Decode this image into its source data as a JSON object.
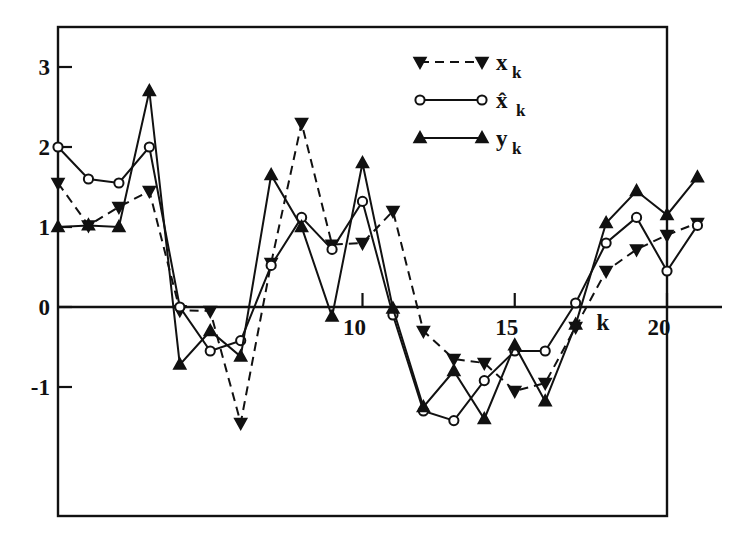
{
  "figure": {
    "background": "#ffffff",
    "ink_color": "#111111",
    "frame": {
      "left": 58,
      "right": 667,
      "top": 27,
      "bottom": 516
    }
  },
  "axes": {
    "y_ticks": [
      "3",
      "2",
      "1",
      "0",
      "-1"
    ],
    "y_tick_values": [
      3,
      2,
      1,
      0,
      -1
    ],
    "x_ticks": [
      "10",
      "15",
      "20"
    ],
    "x_tick_values": [
      10,
      15,
      20
    ],
    "x_axis_title": "k",
    "y_axis_title": "",
    "zero_line": true,
    "grid": false
  },
  "legend": {
    "position": "top-right-inside",
    "entries": [
      {
        "label": "x",
        "subscript": "k",
        "marker": "down-triangle",
        "line": "dashed",
        "name": "legend-x"
      },
      {
        "label": "x̂",
        "subscript": "k",
        "marker": "circle-open",
        "line": "solid",
        "name": "legend-xhat"
      },
      {
        "label": "y",
        "subscript": "k",
        "marker": "up-triangle",
        "line": "solid",
        "name": "legend-y"
      }
    ]
  },
  "chart_data": {
    "type": "line",
    "title": "",
    "xlabel": "k",
    "ylabel": "",
    "xlim": [
      0,
      21
    ],
    "ylim": [
      -1.85,
      3.45
    ],
    "grid": false,
    "legend_position": "top-right",
    "x": [
      0,
      1,
      2,
      3,
      4,
      5,
      6,
      7,
      8,
      9,
      10,
      11,
      12,
      13,
      14,
      15,
      16,
      17,
      18,
      19,
      20,
      21
    ],
    "series": [
      {
        "name": "x_k",
        "label": "x",
        "subscript": "k",
        "marker": "down-triangle",
        "linestyle": "dashed",
        "values": [
          1.55,
          1.02,
          1.25,
          1.45,
          -0.04,
          -0.05,
          -1.45,
          0.55,
          2.3,
          0.78,
          0.8,
          1.2,
          -0.3,
          -0.65,
          -0.7,
          -1.05,
          -0.95,
          -0.25,
          0.45,
          0.72,
          0.9,
          1.05
        ]
      },
      {
        "name": "xhat_k",
        "label": "x̂",
        "subscript": "k",
        "marker": "circle-open",
        "linestyle": "solid",
        "values": [
          2.0,
          1.6,
          1.55,
          2.0,
          0.0,
          -0.55,
          -0.42,
          0.52,
          1.12,
          0.72,
          1.32,
          -0.1,
          -1.3,
          -1.42,
          -0.92,
          -0.55,
          -0.55,
          0.05,
          0.8,
          1.12,
          0.45,
          1.02
        ]
      },
      {
        "name": "y_k",
        "label": "y",
        "subscript": "k",
        "marker": "up-triangle",
        "linestyle": "solid",
        "values": [
          1.0,
          1.02,
          1.0,
          2.7,
          -0.72,
          -0.3,
          -0.62,
          1.65,
          1.0,
          -0.12,
          1.8,
          -0.02,
          -1.25,
          -0.8,
          -1.4,
          -0.48,
          -1.18,
          -0.22,
          1.05,
          1.45,
          1.15,
          1.62
        ]
      }
    ]
  }
}
